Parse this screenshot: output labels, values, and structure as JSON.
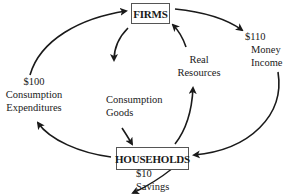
{
  "diagram": {
    "type": "circular-flow",
    "nodes": {
      "firms": {
        "label": "FIRMS"
      },
      "households": {
        "label": "HOUSEHOLDS"
      }
    },
    "flows": {
      "consumption_expenditures": {
        "amount": "$100",
        "line1": "Consumption",
        "line2": "Expenditures",
        "from": "households",
        "to": "firms"
      },
      "money_income": {
        "amount": "$110",
        "line1": "Money",
        "line2": "Income",
        "from": "firms",
        "to": "households"
      },
      "consumption_goods": {
        "line1": "Consumption",
        "line2": "Goods",
        "from": "firms",
        "to": "households"
      },
      "real_resources": {
        "line1": "Real",
        "line2": "Resources",
        "from": "households",
        "to": "firms"
      },
      "savings": {
        "amount": "$10",
        "line1": "Savings",
        "from": "households",
        "to": "leakage"
      }
    },
    "colors": {
      "line": "#1a1a1a",
      "box_border": "#555555"
    }
  }
}
